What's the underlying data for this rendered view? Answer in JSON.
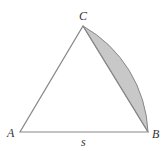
{
  "diagram": {
    "type": "geometry",
    "vertices": {
      "A": {
        "label": "A",
        "x": 20,
        "y": 132
      },
      "B": {
        "label": "B",
        "x": 148,
        "y": 132
      },
      "C": {
        "label": "C",
        "x": 83,
        "y": 26
      }
    },
    "side_label": "s",
    "colors": {
      "stroke": "#888888",
      "shade": "#c8c8c8",
      "text": "#333333"
    }
  }
}
